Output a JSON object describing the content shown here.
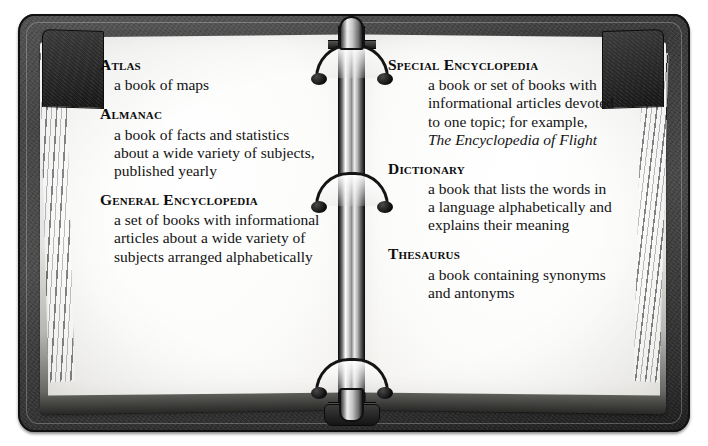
{
  "illustration": {
    "subject": "open three-ring binder with reference book definitions",
    "left_page_label": "left-page",
    "right_page_label": "right-page"
  },
  "left_column": {
    "entries": [
      {
        "term": "Atlas",
        "definition": "a book of maps"
      },
      {
        "term": "Almanac",
        "definition": "a book of facts and statistics about a wide variety of subjects, published yearly"
      },
      {
        "term": "General Encyclopedia",
        "definition": "a set of books with informational articles about a wide variety of subjects arranged alphabetically"
      }
    ]
  },
  "right_column": {
    "entries": [
      {
        "term": "Special Encyclopedia",
        "definition_part1": "a book or set of books with informational articles devoted to one topic; for example, ",
        "definition_italic": "The Encyclopedia of Flight",
        "definition_part2": ""
      },
      {
        "term": "Dictionary",
        "definition": "a book that lists the words in a language alphabetically and explains their meaning"
      },
      {
        "term": "Thesaurus",
        "definition": "a book containing synonyms and antonyms"
      }
    ]
  },
  "binder": {
    "ring_count": 3,
    "cover_color": "#3b3b3b",
    "paper_color": "#fcfcfb",
    "ink_color": "#131313"
  }
}
